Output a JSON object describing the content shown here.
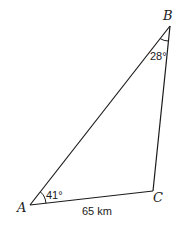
{
  "diagram": {
    "type": "triangle",
    "vertices": {
      "A": {
        "label": "A"
      },
      "B": {
        "label": "B"
      },
      "C": {
        "label": "C"
      }
    },
    "angles": {
      "A": {
        "label": "41°"
      },
      "B": {
        "label": "28°"
      }
    },
    "sides": {
      "AC": {
        "label": "65 km"
      }
    },
    "colors": {
      "line": "#1a1a1a",
      "background": "#ffffff"
    }
  }
}
